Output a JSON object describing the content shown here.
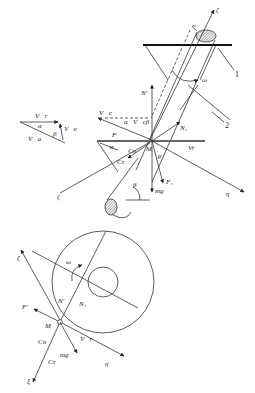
{
  "figure": {
    "callouts": [
      "1",
      "2"
    ],
    "top_view": {
      "axis_labels": {
        "zeta_top": "ζ",
        "zeta_left": "ζ",
        "eta": "η"
      },
      "angle_labels": {
        "omega": "ω",
        "alpha": "α",
        "beta": "β",
        "theta": "θ",
        "rho": "ρ"
      },
      "vectors": {
        "Vc": "V⃗c",
        "Vcb": "V⃗cβ",
        "Vr": "Vr",
        "N_prime": "N'",
        "N1": "N₁",
        "F": "F",
        "F1": "F₁",
        "Ccn": "Cn",
        "Cct": "Cτ",
        "mg": "mg",
        "M": "M"
      }
    },
    "velocity_triangle": {
      "Vr": "V⃗r",
      "Va": "V⃗a",
      "Ve": "V⃗e",
      "alpha": "α",
      "beta": "β"
    },
    "bottom_view": {
      "zeta": "ζ",
      "xi": "ξ",
      "eta": "η",
      "omega": "ω",
      "N_prime": "N'",
      "N1": "N₁",
      "F_prime": "F'",
      "M": "M",
      "Cn": "Cn",
      "Ct": "Cτ",
      "mg": "mg",
      "Vr": "V⃗r"
    }
  }
}
